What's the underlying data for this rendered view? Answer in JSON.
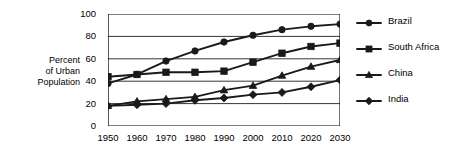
{
  "chart_data": {
    "type": "line",
    "title": "",
    "xlabel": "",
    "ylabel": "Percent of Urban Population",
    "ylabel_lines": [
      "Percent",
      "of Urban",
      "Population"
    ],
    "x": [
      1950,
      1960,
      1970,
      1980,
      1990,
      2000,
      2010,
      2020,
      2030
    ],
    "categories": [
      "1950",
      "1960",
      "1970",
      "1980",
      "1990",
      "2000",
      "2010",
      "2020",
      "2030"
    ],
    "xlim": [
      1950,
      2030
    ],
    "ylim": [
      0,
      100
    ],
    "yticks": [
      0,
      20,
      40,
      60,
      80,
      100
    ],
    "ytick_labels": [
      "0",
      "20",
      "40",
      "60",
      "80",
      "100"
    ],
    "grid": "horizontal",
    "legend_position": "right",
    "line_color": "#1a1a1a",
    "series": [
      {
        "name": "Brazil",
        "marker": "circle",
        "color": "#1a1a1a",
        "values": [
          38,
          46,
          58,
          67,
          75,
          81,
          86,
          89,
          91
        ]
      },
      {
        "name": "South Africa",
        "marker": "square",
        "color": "#1a1a1a",
        "values": [
          44,
          46,
          48,
          48,
          49,
          57,
          65,
          71,
          74
        ]
      },
      {
        "name": "China",
        "marker": "triangle",
        "color": "#1a1a1a",
        "values": [
          18,
          22,
          24,
          26,
          32,
          36,
          45,
          53,
          59
        ]
      },
      {
        "name": "India",
        "marker": "diamond",
        "color": "#1a1a1a",
        "values": [
          18,
          19,
          20,
          23,
          25,
          28,
          30,
          35,
          41
        ]
      }
    ]
  }
}
